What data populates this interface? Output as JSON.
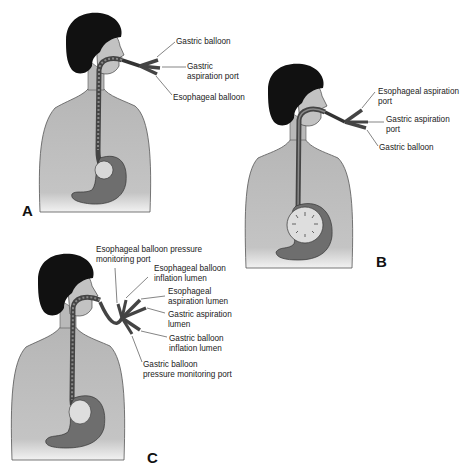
{
  "figure": {
    "panels": [
      {
        "id": "A",
        "letter": "A",
        "labels": [
          {
            "key": "gastric_balloon",
            "text": "Gastric balloon"
          },
          {
            "key": "gastric_aspiration_port",
            "text": "Gastric\naspiration port"
          },
          {
            "key": "esophageal_balloon",
            "text": "Esophageal balloon"
          }
        ]
      },
      {
        "id": "B",
        "letter": "B",
        "labels": [
          {
            "key": "esophageal_aspiration_port",
            "text": "Esophageal aspiration\nport"
          },
          {
            "key": "gastric_aspiration_port",
            "text": "Gastric aspiration\nport"
          },
          {
            "key": "gastric_balloon",
            "text": "Gastric balloon"
          }
        ]
      },
      {
        "id": "C",
        "letter": "C",
        "labels": [
          {
            "key": "esophageal_balloon_pressure_monitoring_port",
            "text": "Esophageal balloon pressure\nmonitoring port"
          },
          {
            "key": "esophageal_balloon_inflation_lumen",
            "text": "Esophageal balloon\ninflation lumen"
          },
          {
            "key": "esophageal_aspiration_lumen",
            "text": "Esophageal\naspiration lumen"
          },
          {
            "key": "gastric_aspiration_lumen",
            "text": "Gastric aspiration\nlumen"
          },
          {
            "key": "gastric_balloon_inflation_lumen",
            "text": "Gastric balloon\ninflation lumen"
          },
          {
            "key": "gastric_balloon_pressure_monitoring_port",
            "text": "Gastric balloon\npressure monitoring port"
          }
        ]
      }
    ],
    "colors": {
      "skin": "#b9b9b9",
      "hair": "#111111",
      "tube": "#5a5a5a",
      "stomach": "#6e6e6e",
      "background": "#ffffff"
    }
  }
}
